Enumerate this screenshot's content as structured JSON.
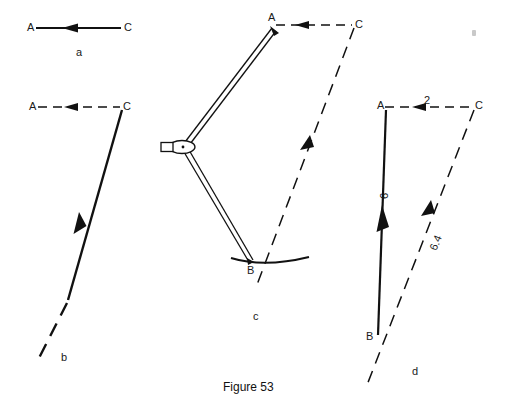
{
  "figure": {
    "caption": "Figure 53",
    "panels": [
      {
        "key": "a",
        "label": "a",
        "points": {
          "A": "A",
          "C": "C"
        },
        "description": "single solid line from A to C with arrowhead pointing toward A"
      },
      {
        "key": "b",
        "label": "b",
        "points": {
          "A": "A",
          "C": "C"
        },
        "description": "dashed horizontal A to C with arrow toward A, solid line down-left from C with arrowhead, continuing dashed"
      },
      {
        "key": "c",
        "label": "c",
        "points": {
          "A": "A",
          "C": "C",
          "B": "B"
        },
        "description": "drafting compass stepping distance from A to arc at B, dashed construction lines"
      },
      {
        "key": "d",
        "label": "d",
        "points": {
          "A": "A",
          "B": "B",
          "C": "C"
        },
        "description": "completed vector triangle with magnitudes",
        "magnitudes": [
          {
            "name": "horizontal",
            "value": "2"
          },
          {
            "name": "vertical",
            "value": "6"
          },
          {
            "name": "resultant",
            "value": "6.4"
          }
        ]
      }
    ]
  },
  "style": {
    "ink": "#111111",
    "paper": "#ffffff",
    "artifact": "#c9c9c9"
  }
}
